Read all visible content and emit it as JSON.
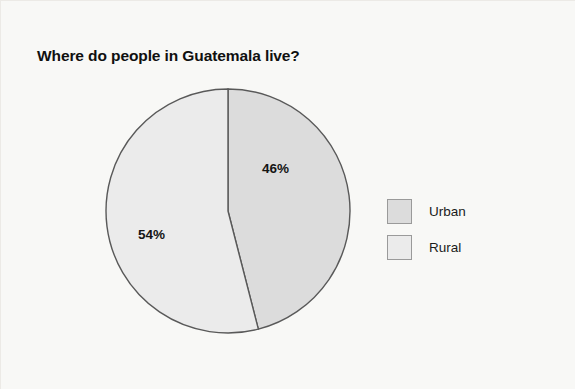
{
  "figure": {
    "background_color": "#f8f8f6",
    "border_color": "#eceae6"
  },
  "title": "Where do people in Guatemala live?",
  "labels": {
    "urban_percent": "46%",
    "rural_percent": "54%"
  },
  "legend": {
    "items": [
      {
        "label": "Urban",
        "color": "#dcdcdc"
      },
      {
        "label": "Rural",
        "color": "#ebebeb"
      }
    ]
  },
  "chart_data": {
    "type": "pie",
    "title": "Where do people in Guatemala live?",
    "categories": [
      "Urban",
      "Rural"
    ],
    "values": [
      46,
      54
    ],
    "value_labels": [
      "46%",
      "54%"
    ],
    "colors": [
      "#dcdcdc",
      "#ebebeb"
    ],
    "slice_border_color": "#595959",
    "start_angle_deg": 90,
    "direction": "clockwise",
    "legend_position": "right",
    "grid": false,
    "xlabel": "",
    "ylabel": ""
  }
}
